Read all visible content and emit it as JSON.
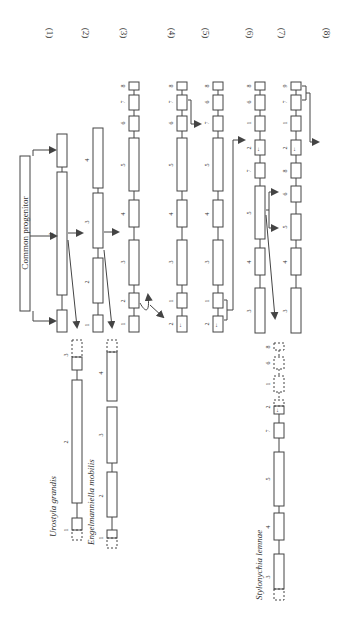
{
  "figure": {
    "orientation": "rotated-90-ccw",
    "stroke_color": "#444444",
    "common_progenitor_label": "Common progenitor",
    "column_labels": [
      "(1)",
      "(2)",
      "(3)",
      "(4)",
      "(5)",
      "(6)",
      "(7)",
      "(8)"
    ],
    "species": [
      {
        "name": "Urostyla grandis",
        "segments": [
          "1",
          "2",
          "3"
        ]
      },
      {
        "name": "Engelmanniella mobilis",
        "segments": [
          "1",
          "2",
          "3",
          "4"
        ]
      },
      {
        "name": "Stylonychia lemnae",
        "segments": [
          "3",
          "4",
          "5",
          "7",
          "2",
          "1",
          "6",
          "8"
        ]
      }
    ],
    "stages": [
      {
        "label": "(1)",
        "segments_bottom_to_top": [
          "1",
          "2",
          "3"
        ]
      },
      {
        "label": "(2)",
        "segments_bottom_to_top": [
          "1",
          "2",
          "3",
          "4"
        ]
      },
      {
        "label": "(3)",
        "segments_bottom_to_top": [
          "1",
          "2",
          "3",
          "4",
          "5",
          "6",
          "7",
          "8"
        ]
      },
      {
        "label": "(4)",
        "segments_bottom_to_top": [
          "2",
          "1",
          "3",
          "4",
          "5",
          "6",
          "7",
          "8"
        ]
      },
      {
        "label": "(5)",
        "segments_bottom_to_top": [
          "2",
          "1",
          "3",
          "4",
          "5",
          "7",
          "6",
          "8"
        ]
      },
      {
        "label": "(6)",
        "segments_bottom_to_top": [
          "3",
          "4",
          "5",
          "7",
          "2",
          "1",
          "6",
          "8"
        ]
      },
      {
        "label": "(7)",
        "segments_bottom_to_top": [
          "3",
          "4",
          "5",
          "6",
          "8",
          "2",
          "1",
          "7",
          "9"
        ]
      },
      {
        "label": "(8)",
        "segments_bottom_to_top": []
      }
    ],
    "labels": {
      "s1": "1",
      "s2": "2",
      "s3": "3",
      "s4": "4",
      "s5": "5",
      "s6": "6",
      "s7": "7",
      "s8": "8",
      "s9": "9"
    }
  }
}
